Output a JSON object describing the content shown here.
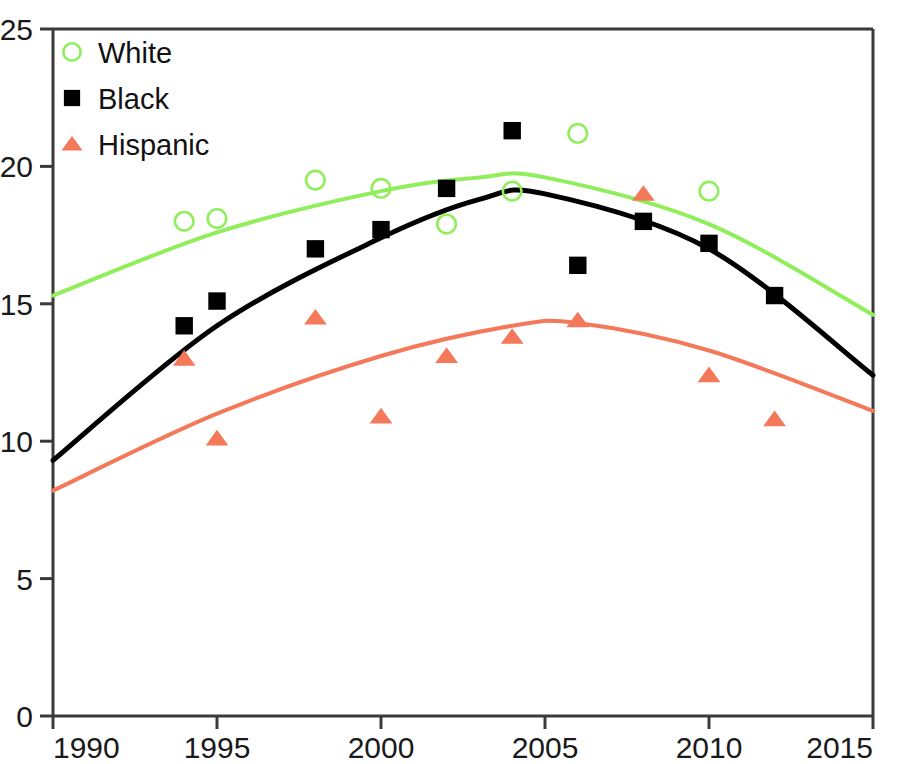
{
  "chart_data": {
    "type": "scatter",
    "title": "",
    "subtitle": "",
    "xlabel": "",
    "ylabel": "",
    "xlim": [
      1990,
      2015
    ],
    "ylim": [
      0,
      25
    ],
    "xticks": [
      1990,
      1995,
      2000,
      2005,
      2010,
      2015
    ],
    "yticks": [
      0,
      5,
      10,
      15,
      20,
      25
    ],
    "xtick_labels": [
      "1990",
      "1995",
      "2000",
      "2005",
      "2010",
      "2015"
    ],
    "ytick_labels": [
      "0",
      "5",
      "10",
      "15",
      "20",
      "25"
    ],
    "grid": false,
    "legend_position": "top-left",
    "series": [
      {
        "name": "White",
        "marker": "open-circle",
        "color": "#90EE5A",
        "trend": "quadratic",
        "points": [
          {
            "x": 1994,
            "y": 18.0
          },
          {
            "x": 1995,
            "y": 18.1
          },
          {
            "x": 1998,
            "y": 19.5
          },
          {
            "x": 2000,
            "y": 19.2
          },
          {
            "x": 2002,
            "y": 17.9
          },
          {
            "x": 2004,
            "y": 19.1
          },
          {
            "x": 2006,
            "y": 21.2
          },
          {
            "x": 2010,
            "y": 19.1
          }
        ],
        "trend_points": [
          {
            "x": 1990,
            "y": 15.3
          },
          {
            "x": 1995,
            "y": 17.6
          },
          {
            "x": 2000,
            "y": 19.1
          },
          {
            "x": 2003,
            "y": 19.6
          },
          {
            "x": 2005,
            "y": 19.6
          },
          {
            "x": 2010,
            "y": 17.9
          },
          {
            "x": 2015,
            "y": 14.6
          }
        ]
      },
      {
        "name": "Black",
        "marker": "filled-square",
        "color": "#000000",
        "trend": "quadratic",
        "points": [
          {
            "x": 1994,
            "y": 14.2
          },
          {
            "x": 1995,
            "y": 15.1
          },
          {
            "x": 1998,
            "y": 17.0
          },
          {
            "x": 2000,
            "y": 17.7
          },
          {
            "x": 2002,
            "y": 19.2
          },
          {
            "x": 2004,
            "y": 21.3
          },
          {
            "x": 2006,
            "y": 16.4
          },
          {
            "x": 2008,
            "y": 18.0
          },
          {
            "x": 2010,
            "y": 17.2
          },
          {
            "x": 2012,
            "y": 15.3
          }
        ],
        "trend_points": [
          {
            "x": 1990,
            "y": 9.3
          },
          {
            "x": 1995,
            "y": 14.2
          },
          {
            "x": 2000,
            "y": 17.4
          },
          {
            "x": 2003,
            "y": 18.8
          },
          {
            "x": 2005,
            "y": 19.0
          },
          {
            "x": 2010,
            "y": 17.0
          },
          {
            "x": 2015,
            "y": 12.4
          }
        ]
      },
      {
        "name": "Hispanic",
        "marker": "filled-triangle",
        "color": "#F4795B",
        "trend": "quadratic",
        "points": [
          {
            "x": 1994,
            "y": 13.0
          },
          {
            "x": 1995,
            "y": 10.1
          },
          {
            "x": 1998,
            "y": 14.5
          },
          {
            "x": 2000,
            "y": 10.9
          },
          {
            "x": 2002,
            "y": 13.1
          },
          {
            "x": 2004,
            "y": 13.8
          },
          {
            "x": 2006,
            "y": 14.4
          },
          {
            "x": 2008,
            "y": 19.0
          },
          {
            "x": 2010,
            "y": 12.4
          },
          {
            "x": 2012,
            "y": 10.8
          }
        ],
        "trend_points": [
          {
            "x": 1990,
            "y": 8.2
          },
          {
            "x": 1995,
            "y": 11.0
          },
          {
            "x": 2000,
            "y": 13.1
          },
          {
            "x": 2004,
            "y": 14.2
          },
          {
            "x": 2006,
            "y": 14.3
          },
          {
            "x": 2010,
            "y": 13.3
          },
          {
            "x": 2015,
            "y": 11.1
          }
        ]
      }
    ]
  },
  "legend": {
    "entries": [
      {
        "label": "White",
        "marker": "open-circle",
        "color": "#90EE5A"
      },
      {
        "label": "Black",
        "marker": "filled-square",
        "color": "#000000"
      },
      {
        "label": "Hispanic",
        "marker": "filled-triangle",
        "color": "#F4795B"
      }
    ]
  },
  "axes": {
    "x_labels": [
      "1990",
      "1995",
      "2000",
      "2005",
      "2010",
      "2015"
    ],
    "y_labels": [
      "0",
      "5",
      "10",
      "15",
      "20",
      "25"
    ],
    "axis_color": "#3a3a3a"
  }
}
